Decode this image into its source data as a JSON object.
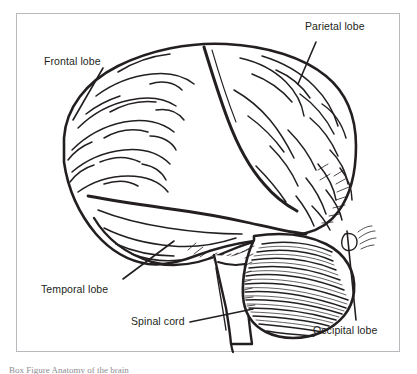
{
  "figure": {
    "title": "Anatomy of the brain",
    "frame": {
      "border_color": "#b9b9bd",
      "background": "#ffffff",
      "x": 16,
      "y": 13,
      "width": 384,
      "height": 339
    },
    "ink_color": "#231f20",
    "labels": [
      {
        "id": "frontal",
        "text": "Frontal lobe",
        "x": 44,
        "y": 55,
        "leader": {
          "from_x": 103,
          "from_y": 68,
          "to_x": 73,
          "to_y": 120
        }
      },
      {
        "id": "parietal",
        "text": "Parietal lobe",
        "x": 305,
        "y": 20,
        "leader": {
          "from_x": 316,
          "from_y": 42,
          "to_x": 298,
          "to_y": 84
        }
      },
      {
        "id": "temporal",
        "text": "Temporal lobe",
        "x": 41,
        "y": 283,
        "leader": {
          "from_x": 123,
          "from_y": 279,
          "to_x": 174,
          "to_y": 241
        }
      },
      {
        "id": "spinal",
        "text": "Spinal cord",
        "x": 131,
        "y": 315,
        "leader": {
          "from_x": 190,
          "from_y": 322,
          "to_x": 253,
          "to_y": 309
        }
      },
      {
        "id": "occipital",
        "text": "Occipital lobe",
        "x": 313,
        "y": 324,
        "leader": {
          "from_x": 356,
          "from_y": 320,
          "to_x": 347,
          "to_y": 231
        }
      }
    ],
    "structures": [
      "cerebrum",
      "frontal-lobe",
      "parietal-lobe",
      "temporal-lobe",
      "occipital-lobe",
      "cerebellum",
      "brainstem",
      "spinal-cord",
      "central-sulcus",
      "lateral-sulcus"
    ]
  },
  "caption": {
    "text": "Box Figure  Anatomy of the brain"
  }
}
